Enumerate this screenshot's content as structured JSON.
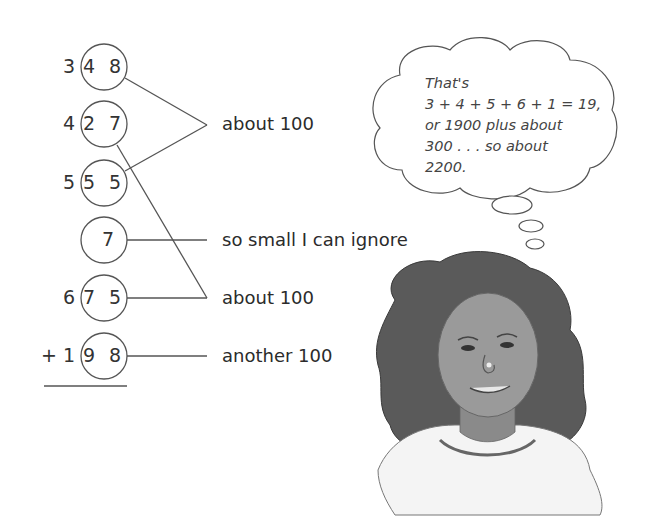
{
  "rows": [
    {
      "hundreds": "3",
      "circled": "4 8"
    },
    {
      "hundreds": "4",
      "circled": "2 7"
    },
    {
      "hundreds": "5",
      "circled": "5 5"
    },
    {
      "hundreds": "",
      "circled": "7"
    },
    {
      "hundreds": "6",
      "circled": "7 5"
    },
    {
      "hundreds": "+ 1",
      "circled": "9 8"
    }
  ],
  "labels": {
    "pair1": "about 100",
    "small": "so small I can ignore",
    "pair2": "about 100",
    "last": "another 100"
  },
  "thought_bubble": {
    "lines": [
      "That's",
      "3 + 4 + 5 + 6 + 1 = 19,",
      "or 1900 plus about",
      "300 . . . so about",
      "2200."
    ]
  },
  "illustration": {
    "subject": "smiling girl with curly hair thinking"
  }
}
